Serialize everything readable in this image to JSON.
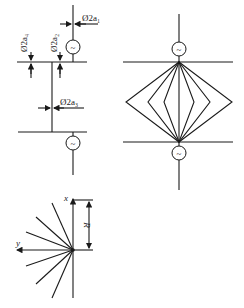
{
  "figure": {
    "left_top": {
      "labels": {
        "a1": "Ø2a₁",
        "a2": "Ø2a₂",
        "a3": "Ø2a₃",
        "a4": "Ø2a₄"
      },
      "source_symbol": "~"
    },
    "right": {
      "source_symbol": "~",
      "description": "Two parallel buses with fan of wires forming nested diamonds between two sources"
    },
    "coordinate": {
      "x_label": "x",
      "y_label": "y",
      "r_label": "R"
    }
  }
}
